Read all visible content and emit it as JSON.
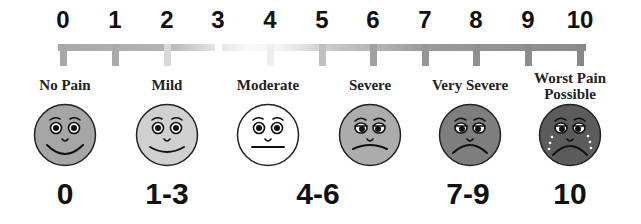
{
  "scale": {
    "ticks": [
      "0",
      "1",
      "2",
      "3",
      "4",
      "5",
      "6",
      "7",
      "8",
      "9",
      "10"
    ],
    "tick_x": [
      63,
      115,
      167,
      218,
      270,
      322,
      373,
      425,
      476,
      528,
      580
    ],
    "tick_colors": [
      "#a8a8a8",
      "#aaaaaa",
      "#d8d8d8",
      "#ffffff",
      "#eeeeee",
      "#c0c0c0",
      "#a0a0a0",
      "#969696",
      "#909090",
      "#8c8c8c",
      "#888888"
    ]
  },
  "levels": [
    {
      "label": "No Pain",
      "range": "0",
      "x": 65,
      "face_color": "#a6a6a6",
      "mood": "happy",
      "tears": false
    },
    {
      "label": "Mild",
      "range": "1-3",
      "x": 167,
      "face_color": "#d0d0d0",
      "mood": "smile",
      "tears": false
    },
    {
      "label": "Moderate",
      "range": "4-6",
      "x": 268,
      "face_color": "#ffffff",
      "mood": "neutral",
      "tears": false
    },
    {
      "label": "Severe",
      "range": "",
      "x": 370,
      "face_color": "#acacac",
      "mood": "frown",
      "tears": false
    },
    {
      "label": "Very Severe",
      "range": "7-9",
      "x": 470,
      "face_color": "#7e7e7e",
      "mood": "sad",
      "tears": false
    },
    {
      "label": "Worst Pain Possible",
      "range": "10",
      "x": 570,
      "face_color": "#5c5c5c",
      "mood": "cry",
      "tears": true
    }
  ],
  "bottom_numbers": [
    {
      "text": "0",
      "x": 65
    },
    {
      "text": "1-3",
      "x": 167
    },
    {
      "text": "4-6",
      "x": 318
    },
    {
      "text": "7-9",
      "x": 468
    },
    {
      "text": "10",
      "x": 570
    }
  ]
}
